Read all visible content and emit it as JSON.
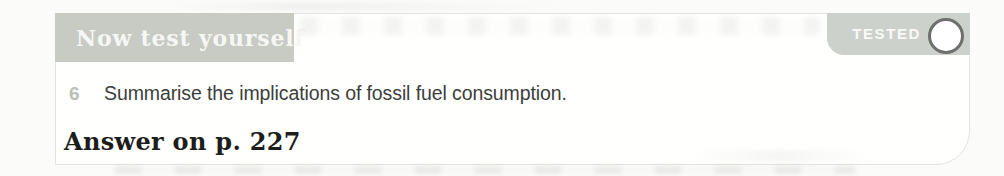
{
  "panel": {
    "header": {
      "label": "Now test yourself",
      "background_color": "#c7cbc4",
      "text_color": "#f6f7f4"
    },
    "tested_badge": {
      "label": "TESTED",
      "background_color": "#cdd1cb",
      "text_color": "#fcfdfa",
      "circle_border_color": "#6e706d",
      "circle_fill": "#ffffff",
      "checked": false
    },
    "question": {
      "number": "6",
      "number_color": "#b9c0b5",
      "text": "Summarise the implications of fossil fuel consumption.",
      "text_color": "#3b3e3b"
    },
    "answer_note": "Answer on p. 227",
    "panel_border_color": "#e3e4df",
    "panel_background": "#fffffe"
  }
}
